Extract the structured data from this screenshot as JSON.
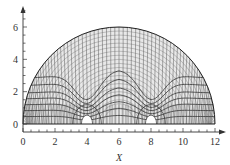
{
  "chart_data": {
    "type": "diagram-plot",
    "title": "",
    "xlabel": "X",
    "ylabel": "Y",
    "xlim": [
      0,
      12
    ],
    "ylim": [
      0,
      6
    ],
    "x_ticks": [
      "0",
      "2",
      "4",
      "6",
      "8",
      "10",
      "12"
    ],
    "y_ticks": [
      "0",
      "2",
      "4",
      "6"
    ],
    "grid": false,
    "domain_boundary": {
      "shape": "semicircle",
      "center": [
        6,
        0
      ],
      "radius": 6
    },
    "singular_points": [
      [
        4,
        0
      ],
      [
        8,
        0
      ]
    ]
  },
  "axis": {
    "x_label": "X",
    "y_label": "Y",
    "x_ticks": [
      "0",
      "2",
      "4",
      "6",
      "8",
      "10",
      "12"
    ],
    "y_ticks": [
      "0",
      "2",
      "4",
      "6"
    ]
  }
}
